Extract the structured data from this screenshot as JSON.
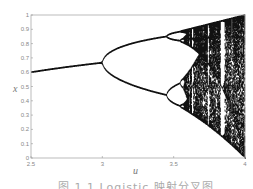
{
  "chart_data": {
    "type": "scatter",
    "title": "",
    "xlabel": "u",
    "ylabel": "x",
    "xlim": [
      2.5,
      4.0
    ],
    "ylim": [
      0,
      1
    ],
    "xticks": [
      "2.5",
      "3",
      "3.5",
      "4"
    ],
    "yticks": [
      "0",
      "0.1",
      "0.2",
      "0.3",
      "0.4",
      "0.5",
      "0.6",
      "0.7",
      "0.8",
      "0.9",
      "1"
    ],
    "grid": false,
    "legend": null,
    "series": [
      {
        "name": "logistic map attractor",
        "key_points": [
          {
            "u": 2.5,
            "x": [
              0.6
            ]
          },
          {
            "u": 3.0,
            "x": [
              0.667
            ]
          },
          {
            "u": 3.2,
            "x": [
              0.513,
              0.799
            ]
          },
          {
            "u": 3.5,
            "x": [
              0.383,
              0.501,
              0.827,
              0.875
            ]
          },
          {
            "u": 3.83,
            "x": [
              0.156,
              0.505,
              0.957
            ]
          },
          {
            "u": 4.0,
            "x": [
              0.0,
              1.0
            ]
          }
        ]
      }
    ],
    "sim": {
      "u_start": 2.5,
      "u_end": 4.0,
      "u_steps": 430,
      "transient": 300,
      "plot_iters": 120,
      "x0": 0.5
    }
  },
  "axes": {
    "xlabel": "u",
    "ylabel": "x"
  },
  "caption": "图 1.1  Logistic 映射分叉图",
  "colors": {
    "points": "#111111",
    "axis": "#999999",
    "text": "#888888"
  }
}
